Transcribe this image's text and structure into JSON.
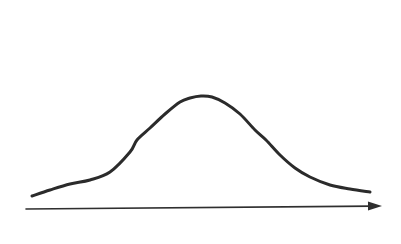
{
  "figure": {
    "caption": "Hand-drawn normal distribution curve above a horizontal arrow axis",
    "background_color": "#ffffff",
    "width": 401,
    "height": 244
  },
  "style": {
    "stroke_color": "#2b2b2b",
    "curve_stroke_width": 3.0,
    "axis_stroke_color": "#2f2f2f",
    "axis_stroke_width": 1.6,
    "arrowhead_color": "#2f2f2f"
  },
  "chart_data": {
    "type": "line",
    "subtitle": "",
    "xlabel": "",
    "ylabel": "",
    "legend": [],
    "legend_position": "none",
    "grid": false,
    "axis_ticks": [],
    "tick_labels": [],
    "annotations": [],
    "xlim": [
      32,
      370
    ],
    "ylim": [
      96,
      196
    ],
    "distribution": {
      "shape": "gaussian",
      "peak_x": 201,
      "peak_y": 96,
      "baseline_y": 196,
      "left_tail_x": 32,
      "left_tail_y": 196,
      "right_tail_x": 370,
      "right_tail_y": 192,
      "left_inflection_x": 137,
      "left_inflection_y": 140,
      "right_inflection_x": 266,
      "right_inflection_y": 140
    },
    "series": [
      {
        "name": "bell-curve",
        "x": [
          32,
          50,
          70,
          90,
          110,
          130,
          137,
          150,
          165,
          180,
          190,
          201,
          212,
          225,
          240,
          255,
          266,
          280,
          295,
          310,
          330,
          350,
          370
        ],
        "y": [
          196,
          190,
          184,
          180,
          172,
          152,
          140,
          128,
          114,
          102,
          98,
          96,
          97,
          103,
          114,
          130,
          140,
          155,
          168,
          177,
          185,
          189,
          192
        ]
      }
    ],
    "axis_arrow": {
      "start_x": 26,
      "start_y": 209,
      "end_x": 382,
      "end_y": 206,
      "arrowhead_length": 14,
      "arrowhead_width": 9,
      "direction": "right"
    }
  }
}
